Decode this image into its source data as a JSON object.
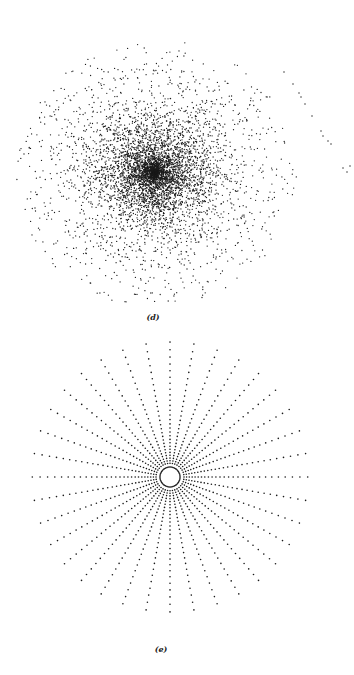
{
  "figure": {
    "panels": [
      {
        "id": "d",
        "label": "(d)",
        "description": "Dense random scatter of points forming a disc-shaped cloud with a small spiral at the center and a sparse trail of points extending to the right",
        "center": [
          155,
          173
        ],
        "core_radius": 90,
        "halo_radius": 135,
        "point_count": 5200,
        "label_pos": [
          153,
          318
        ]
      },
      {
        "id": "e",
        "label": "(e)",
        "description": "Dotted radial rays emanating from a central dotted ring (sunburst pattern)",
        "center": [
          170,
          477
        ],
        "ray_count": 36,
        "inner_ring_radius": 10,
        "outer_radius": 140,
        "label_pos": [
          161,
          650
        ]
      }
    ],
    "colors": {
      "dot": "#1a1a1a",
      "background": "#ffffff"
    }
  }
}
